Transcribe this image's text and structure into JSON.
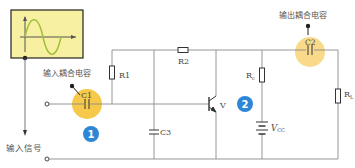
{
  "diagram": {
    "title": "",
    "labels": {
      "input_coupling_cap": "输入耦合电容",
      "output_coupling_cap": "输出耦合电容",
      "input_signal": "输入信号",
      "c1": "C1",
      "c2": "C2",
      "c3": "C3",
      "r1": "R1",
      "r2": "R2",
      "rc": "R",
      "rc_sub": "c",
      "rl": "R",
      "rl_sub": "L",
      "vcc": "V",
      "vcc_sub": "CC",
      "transistor": "V"
    },
    "badges": [
      {
        "number": "1",
        "color": "#2f86d6"
      },
      {
        "number": "2",
        "color": "#2f86d6"
      }
    ],
    "colors": {
      "wire": "#8a8a8a",
      "signal_box_fill": "#f7f0a0",
      "signal_box_border": "#222222",
      "highlight_circle": "#f7c94a",
      "highlight_circle_c2": "#f9d98a",
      "wave": "#9fbf3a"
    }
  }
}
